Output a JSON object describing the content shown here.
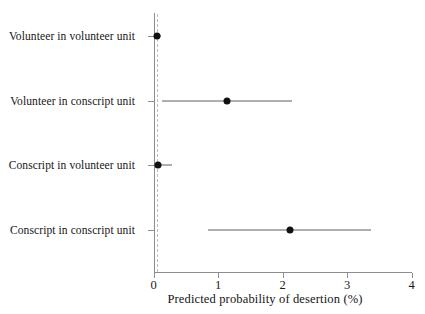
{
  "chart_data": {
    "type": "scatter",
    "subtype": "dot-and-whisker-forest-plot",
    "title": "",
    "xlabel": "Predicted probability of desertion (%)",
    "ylabel": "",
    "xlim": [
      0,
      4
    ],
    "ylim": [
      0,
      4
    ],
    "xticks": [
      0,
      1,
      2,
      3,
      4
    ],
    "xtick_labels": [
      "0",
      "1",
      "2",
      "3",
      "4"
    ],
    "grid": false,
    "legend": false,
    "reference_line": {
      "orientation": "vertical",
      "value": 0.06,
      "style": "dashed",
      "color": "#bdbdbd"
    },
    "categories": [
      "Volunteer in volunteer unit",
      "Volunteer in conscript unit",
      "Conscript in volunteer unit",
      "Conscript in conscript unit"
    ],
    "points": [
      {
        "category": "Volunteer in volunteer unit",
        "estimate": 0.06,
        "ci_low": 0.0,
        "ci_high": 0.12
      },
      {
        "category": "Volunteer in conscript unit",
        "estimate": 1.14,
        "ci_low": 0.13,
        "ci_high": 2.15
      },
      {
        "category": "Conscript in volunteer unit",
        "estimate": 0.07,
        "ci_low": 0.0,
        "ci_high": 0.29
      },
      {
        "category": "Conscript in conscript unit",
        "estimate": 2.12,
        "ci_low": 0.84,
        "ci_high": 3.37
      }
    ],
    "marker_color": "#111111",
    "whisker_color": "#5e5e5e",
    "axis_color": "#8d8d8d"
  },
  "labels": {
    "row_0": "Volunteer in volunteer unit",
    "row_1": "Volunteer in conscript unit",
    "row_2": "Conscript in volunteer unit",
    "row_3": "Conscript in conscript unit"
  },
  "xticks": {
    "t0": "0",
    "t1": "1",
    "t2": "2",
    "t3": "3",
    "t4": "4"
  },
  "axis_title": "Predicted probability of desertion (%)"
}
